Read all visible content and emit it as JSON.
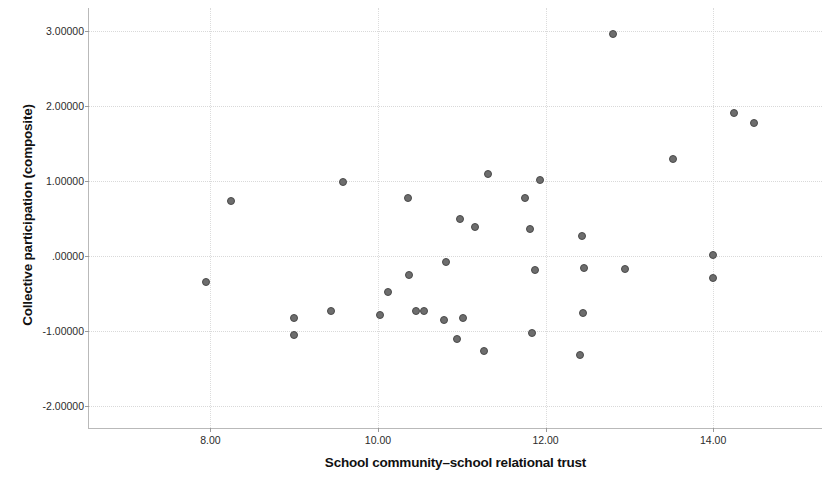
{
  "chart_data": {
    "type": "scatter",
    "title": "",
    "xlabel": "School community–school relational trust",
    "ylabel": "Collective participation (composite)",
    "xlim": [
      6.55,
      15.3
    ],
    "ylim": [
      -2.3,
      3.3
    ],
    "xticks": [
      "8.00",
      "10.00",
      "12.00",
      "14.00"
    ],
    "xtick_values": [
      8,
      10,
      12,
      14
    ],
    "yticks": [
      "3.00000",
      "2.00000",
      "1.00000",
      ".00000",
      "-1.00000",
      "-2.00000"
    ],
    "ytick_values": [
      3,
      2,
      1,
      0,
      -1,
      -2
    ],
    "grid": true,
    "legend": "none",
    "marker_color": "#6d6d6d",
    "marker_edge_color": "#4a4a4a",
    "points": [
      {
        "x": 7.95,
        "y": -0.355
      },
      {
        "x": 8.24,
        "y": 0.724
      },
      {
        "x": 9.0,
        "y": -0.829
      },
      {
        "x": 9.0,
        "y": -1.066
      },
      {
        "x": 9.44,
        "y": -0.737
      },
      {
        "x": 9.58,
        "y": 0.974
      },
      {
        "x": 10.02,
        "y": -0.789
      },
      {
        "x": 10.12,
        "y": -0.487
      },
      {
        "x": 10.36,
        "y": 0.763
      },
      {
        "x": 10.37,
        "y": -0.263
      },
      {
        "x": 10.45,
        "y": -0.737
      },
      {
        "x": 10.55,
        "y": -0.737
      },
      {
        "x": 10.81,
        "y": -0.092
      },
      {
        "x": 10.79,
        "y": -0.855
      },
      {
        "x": 10.94,
        "y": -1.118
      },
      {
        "x": 10.98,
        "y": 0.487
      },
      {
        "x": 11.02,
        "y": -0.829
      },
      {
        "x": 11.16,
        "y": 0.382
      },
      {
        "x": 11.31,
        "y": 1.092
      },
      {
        "x": 11.27,
        "y": -1.276
      },
      {
        "x": 11.76,
        "y": 0.763
      },
      {
        "x": 11.82,
        "y": 0.355
      },
      {
        "x": 11.84,
        "y": -1.039
      },
      {
        "x": 11.87,
        "y": -0.197
      },
      {
        "x": 11.93,
        "y": 1.013
      },
      {
        "x": 12.43,
        "y": 0.263
      },
      {
        "x": 12.46,
        "y": -0.171
      },
      {
        "x": 12.45,
        "y": -0.763
      },
      {
        "x": 12.41,
        "y": -1.329
      },
      {
        "x": 12.8,
        "y": 2.947
      },
      {
        "x": 12.95,
        "y": -0.184
      },
      {
        "x": 13.52,
        "y": 1.289
      },
      {
        "x": 14.0,
        "y": 0.013
      },
      {
        "x": 14.0,
        "y": -0.303
      },
      {
        "x": 14.25,
        "y": 1.895
      },
      {
        "x": 14.49,
        "y": 1.763
      }
    ]
  }
}
